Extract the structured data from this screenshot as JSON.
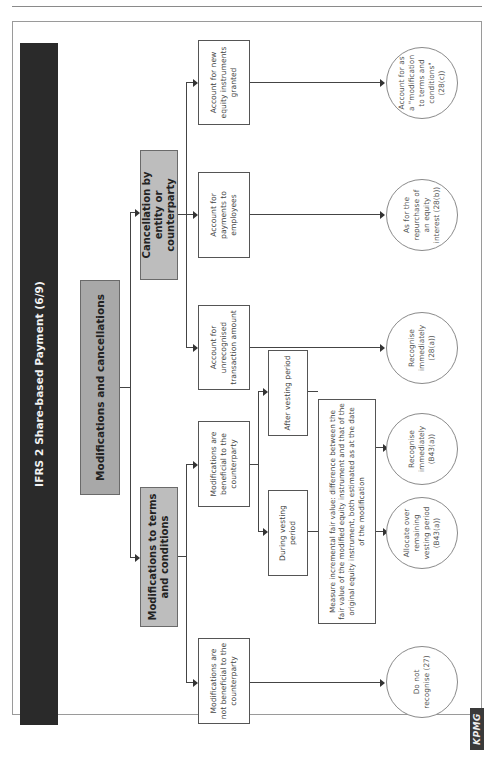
{
  "title": "IFRS 2 Share-based Payment (6/9)",
  "logo": "KPMG",
  "root": {
    "label": "Modifications and cancellations"
  },
  "branches": {
    "modifications": {
      "label": "Modifications to terms and conditions",
      "not_beneficial": {
        "label": "Modifications are not beneficial to the counterparty",
        "outcome": "Do not recognise (27)"
      },
      "beneficial": {
        "label": "Modifications are beneficial to the counterparty",
        "during": {
          "label": "During vesting period",
          "outcome": "Allocate over remaining vesting period (B43(a))"
        },
        "after": {
          "label": "After vesting period",
          "outcome": "Recognise immediately (B43(a))"
        },
        "measure": "Measure incremental fair value: difference between the fair value of the modified equity instrument and that of the original equity instrument, both estimated as at the date of the modification"
      }
    },
    "cancellation": {
      "label": "Cancellation by entity or counterparty",
      "items": [
        {
          "label": "Account for unrecognised transaction amount",
          "outcome": "Recognise immediately (28(a))"
        },
        {
          "label": "Account for payments to employees",
          "outcome": "As for the repurchase of an equity interest (28(b))"
        },
        {
          "label": "Account for new equity instruments granted",
          "outcome": "Account for as a \"modification to terms and conditions\" (28(c))"
        }
      ]
    }
  },
  "colors": {
    "title_bar": "#2a2a2a",
    "root_box": "#a8a8a8",
    "branch_box": "#bdbdbd",
    "line": "#444444"
  }
}
